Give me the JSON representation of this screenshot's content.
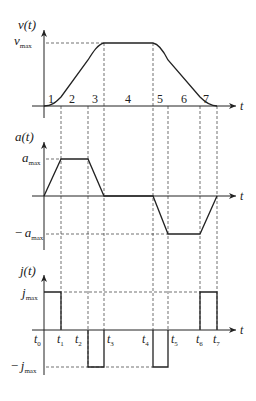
{
  "diagram": {
    "title": "",
    "velocity_plot": {
      "ylabel": "v(t)",
      "xlabel": "t",
      "ymax_label_main": "v",
      "ymax_label_sub": "max",
      "segments": [
        "1",
        "2",
        "3",
        "4",
        "5",
        "6",
        "7"
      ]
    },
    "acceleration_plot": {
      "ylabel": "a(t)",
      "xlabel": "t",
      "ymax_label_main": "a",
      "ymax_label_sub": "max",
      "ymin_label_prefix": "−",
      "ymin_label_main": "a",
      "ymin_label_sub": "max"
    },
    "jerk_plot": {
      "ylabel": "j(t)",
      "xlabel": "t",
      "ymax_label_main": "j",
      "ymax_label_sub": "max",
      "ymin_label_prefix": "−",
      "ymin_label_main": "j",
      "ymin_label_sub": "max",
      "time_labels": [
        {
          "main": "t",
          "sub": "0"
        },
        {
          "main": "t",
          "sub": "1"
        },
        {
          "main": "t",
          "sub": "2"
        },
        {
          "main": "t",
          "sub": "3"
        },
        {
          "main": "t",
          "sub": "4"
        },
        {
          "main": "t",
          "sub": "5"
        },
        {
          "main": "t",
          "sub": "6"
        },
        {
          "main": "t",
          "sub": "7"
        }
      ]
    }
  }
}
